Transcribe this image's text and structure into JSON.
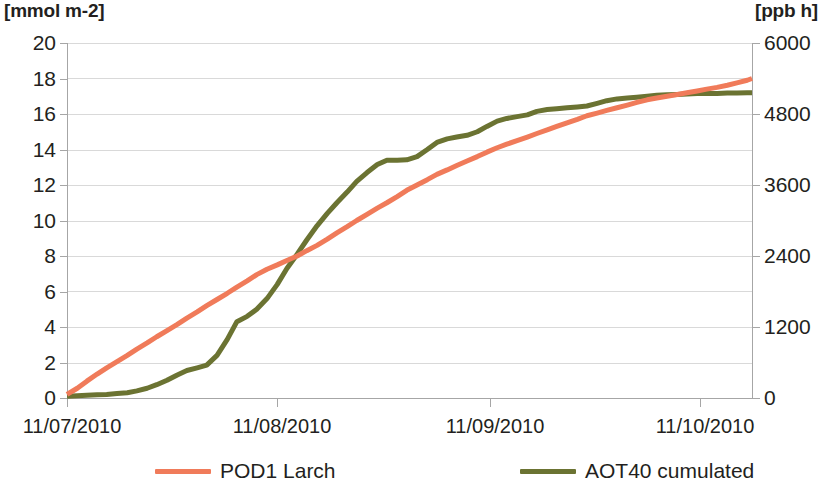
{
  "chart_data": {
    "type": "line",
    "title": "",
    "subtitle": "",
    "xlabel": "",
    "ylabel": "[mmol m-2]",
    "y2label": "[ppb h]",
    "grid": true,
    "legend_position": "bottom",
    "x_tick_labels": [
      "11/07/2010",
      "11/08/2010",
      "11/09/2010",
      "11/10/2010"
    ],
    "x_tick_fractions": [
      0.0,
      0.3066,
      0.6175,
      0.9241
    ],
    "ylim": [
      0,
      20
    ],
    "y_ticks": [
      0,
      2,
      4,
      6,
      8,
      10,
      12,
      14,
      16,
      18,
      20
    ],
    "y2lim": [
      0,
      6000
    ],
    "y2_ticks": [
      0,
      1200,
      2400,
      3600,
      4800,
      6000
    ],
    "colors": {
      "pod1": "#F07B5A",
      "aot40": "#6B7332",
      "gridline": "#D9D9D9",
      "axis": "#A6A6A6",
      "text": "#231F20",
      "background": "#FFFFFF"
    },
    "series": [
      {
        "name": "POD1 Larch",
        "axis": "left",
        "unit": "mmol m-2",
        "color": "#F07B5A",
        "x": [
          0.0,
          0.015,
          0.029,
          0.044,
          0.058,
          0.073,
          0.088,
          0.102,
          0.117,
          0.131,
          0.146,
          0.161,
          0.175,
          0.19,
          0.204,
          0.219,
          0.234,
          0.248,
          0.263,
          0.277,
          0.292,
          0.307,
          0.321,
          0.336,
          0.35,
          0.365,
          0.38,
          0.394,
          0.409,
          0.423,
          0.438,
          0.453,
          0.467,
          0.482,
          0.496,
          0.511,
          0.526,
          0.54,
          0.555,
          0.569,
          0.584,
          0.599,
          0.613,
          0.628,
          0.642,
          0.657,
          0.672,
          0.686,
          0.701,
          0.715,
          0.73,
          0.745,
          0.759,
          0.774,
          0.788,
          0.803,
          0.818,
          0.832,
          0.847,
          0.861,
          0.876,
          0.891,
          0.905,
          0.92,
          0.934,
          0.949,
          0.964,
          0.978,
          0.993,
          1.0
        ],
        "y": [
          0.2,
          0.55,
          0.95,
          1.35,
          1.7,
          2.05,
          2.4,
          2.75,
          3.1,
          3.45,
          3.8,
          4.15,
          4.5,
          4.85,
          5.2,
          5.55,
          5.9,
          6.25,
          6.6,
          6.95,
          7.25,
          7.5,
          7.75,
          8.0,
          8.3,
          8.6,
          8.95,
          9.3,
          9.65,
          10.0,
          10.35,
          10.7,
          11.0,
          11.35,
          11.7,
          12.0,
          12.3,
          12.6,
          12.85,
          13.1,
          13.35,
          13.6,
          13.85,
          14.1,
          14.3,
          14.5,
          14.7,
          14.9,
          15.1,
          15.3,
          15.5,
          15.7,
          15.9,
          16.05,
          16.2,
          16.35,
          16.5,
          16.65,
          16.8,
          16.9,
          17.0,
          17.1,
          17.2,
          17.3,
          17.4,
          17.5,
          17.62,
          17.75,
          17.9,
          18.0
        ]
      },
      {
        "name": "AOT40 cumulated",
        "axis": "right",
        "unit": "ppb h",
        "color": "#6B7332",
        "x": [
          0.0,
          0.015,
          0.029,
          0.044,
          0.058,
          0.073,
          0.088,
          0.102,
          0.117,
          0.131,
          0.146,
          0.161,
          0.175,
          0.19,
          0.204,
          0.219,
          0.234,
          0.248,
          0.263,
          0.277,
          0.292,
          0.307,
          0.321,
          0.336,
          0.35,
          0.365,
          0.38,
          0.394,
          0.409,
          0.423,
          0.438,
          0.453,
          0.467,
          0.482,
          0.496,
          0.511,
          0.526,
          0.54,
          0.555,
          0.569,
          0.584,
          0.599,
          0.613,
          0.628,
          0.642,
          0.657,
          0.672,
          0.686,
          0.701,
          0.715,
          0.73,
          0.745,
          0.759,
          0.774,
          0.788,
          0.803,
          0.818,
          0.832,
          0.847,
          0.861,
          0.876,
          0.891,
          0.905,
          0.92,
          0.934,
          0.949,
          0.964,
          0.978,
          0.993,
          1.0
        ],
        "y_left_equiv": [
          0.1,
          0.12,
          0.15,
          0.18,
          0.2,
          0.25,
          0.3,
          0.4,
          0.55,
          0.75,
          1.0,
          1.3,
          1.55,
          1.7,
          1.85,
          2.4,
          3.3,
          4.3,
          4.6,
          5.0,
          5.6,
          6.4,
          7.3,
          8.1,
          8.9,
          9.7,
          10.4,
          11.0,
          11.6,
          12.2,
          12.7,
          13.15,
          13.4,
          13.4,
          13.42,
          13.6,
          14.0,
          14.4,
          14.6,
          14.7,
          14.8,
          15.0,
          15.3,
          15.6,
          15.75,
          15.85,
          15.95,
          16.15,
          16.25,
          16.3,
          16.35,
          16.4,
          16.45,
          16.6,
          16.75,
          16.85,
          16.9,
          16.95,
          17.0,
          17.05,
          17.08,
          17.1,
          17.12,
          17.15,
          17.15,
          17.16,
          17.18,
          17.18,
          17.2,
          17.2
        ],
        "y": [
          30,
          36,
          45,
          54,
          60,
          75,
          90,
          120,
          165,
          225,
          300,
          390,
          465,
          510,
          555,
          720,
          990,
          1290,
          1380,
          1500,
          1680,
          1920,
          2190,
          2430,
          2670,
          2910,
          3120,
          3300,
          3480,
          3660,
          3810,
          3945,
          4020,
          4020,
          4026,
          4080,
          4200,
          4320,
          4380,
          4410,
          4440,
          4500,
          4590,
          4680,
          4725,
          4755,
          4785,
          4845,
          4875,
          4890,
          4905,
          4920,
          4935,
          4980,
          5025,
          5055,
          5070,
          5085,
          5100,
          5115,
          5124,
          5130,
          5136,
          5145,
          5145,
          5148,
          5154,
          5154,
          5160,
          5160
        ]
      }
    ],
    "annotations": []
  },
  "legend": {
    "items": [
      {
        "label": "POD1 Larch",
        "color": "#F07B5A"
      },
      {
        "label": "AOT40 cumulated",
        "color": "#6B7332"
      }
    ]
  },
  "axes": {
    "left_unit": "[mmol m-2]",
    "right_unit": "[ppb h]",
    "left_ticks": [
      "20",
      "18",
      "16",
      "14",
      "12",
      "10",
      "8",
      "6",
      "4",
      "2",
      "0"
    ],
    "right_ticks": [
      "6000",
      "4800",
      "3600",
      "2400",
      "1200",
      "0"
    ],
    "x_ticks": [
      "11/07/2010",
      "11/08/2010",
      "11/09/2010",
      "11/10/2010"
    ]
  }
}
